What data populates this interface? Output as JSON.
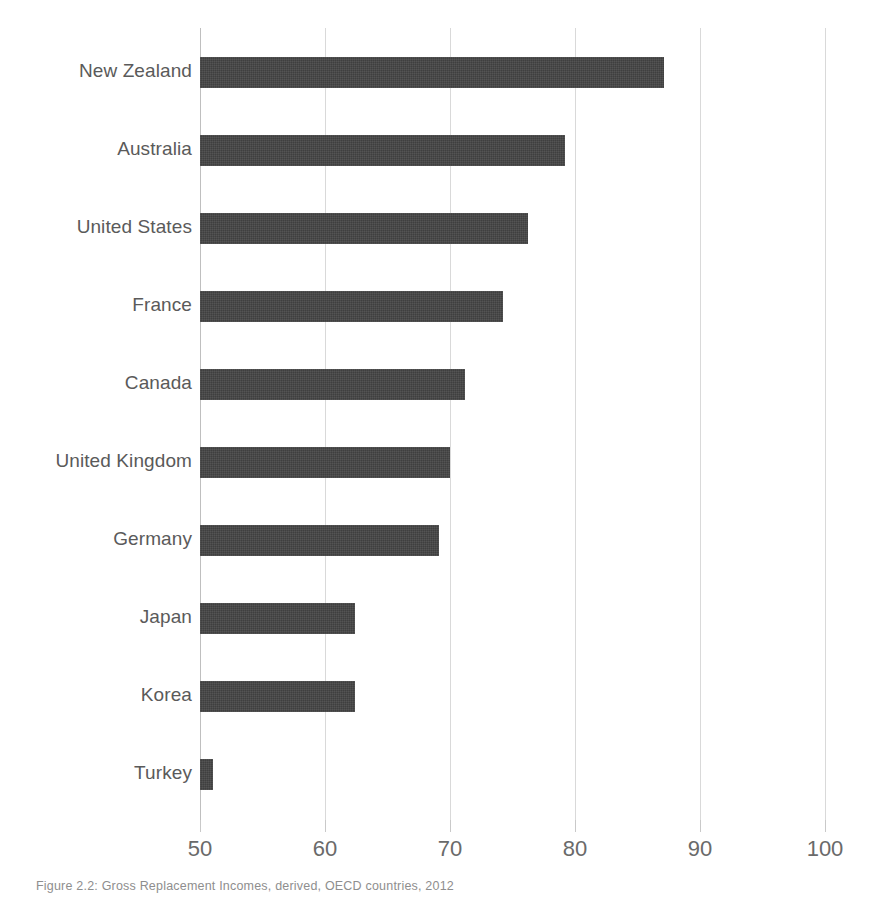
{
  "figure": {
    "caption": "Figure 2.2: Gross Replacement Incomes, derived, OECD countries, 2012"
  },
  "colors": {
    "bar": "#3f3f3f",
    "gridline": "#d9d9d9",
    "axis_line": "#bfbfbf",
    "label_text": "#5a5a5a",
    "tick_text": "#6a6a6a",
    "background": "#ffffff"
  },
  "chart_data": {
    "type": "bar",
    "orientation": "horizontal",
    "title": "",
    "subtitle": "",
    "xlabel": "",
    "ylabel": "",
    "xlim": [
      50,
      100
    ],
    "ylim": null,
    "grid": true,
    "legend": null,
    "legend_position": "none",
    "xticks": [
      50,
      60,
      70,
      80,
      90,
      100
    ],
    "xtick_labels": [
      "50",
      "60",
      "70",
      "80",
      "90",
      "100"
    ],
    "categories": [
      "New Zealand",
      "Australia",
      "United States",
      "France",
      "Canada",
      "United Kingdom",
      "Germany",
      "Japan",
      "Korea",
      "Turkey"
    ],
    "values": [
      87.1,
      79.2,
      76.2,
      74.2,
      71.2,
      70.0,
      69.1,
      62.4,
      62.4,
      51.0
    ],
    "annotations": []
  }
}
